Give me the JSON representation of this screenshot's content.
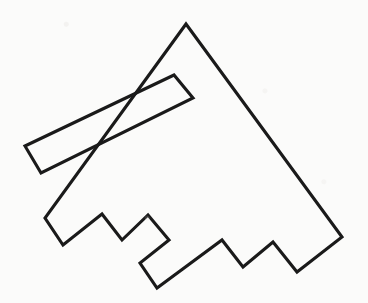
{
  "figure": {
    "title": "",
    "caption": "",
    "type": "line-drawing",
    "background_color": "#fbfbfa",
    "stroke_color": "#1a1a1a",
    "stroke_width": 3.1,
    "fill": "none",
    "canvas": {
      "width": 368,
      "height": 303
    },
    "outline_points": "186,24 342,237 297,272 273,242 243,267 222,240 157,288 140,263 169,240 148,215 122,240 102,214 63,245 45,218",
    "slot_points": "25,146 174,75 193,98 41,173",
    "bleed_through": [
      {
        "id": "bleed-line-1",
        "text": "",
        "left": 78,
        "top": 6,
        "size": 15
      },
      {
        "id": "bleed-line-2",
        "text": "",
        "left": 92,
        "top": 40,
        "size": 15
      },
      {
        "id": "bleed-line-3",
        "text": "",
        "left": 120,
        "top": 118,
        "size": 15
      },
      {
        "id": "bleed-line-4",
        "text": "",
        "left": 95,
        "top": 200,
        "size": 15
      }
    ]
  }
}
